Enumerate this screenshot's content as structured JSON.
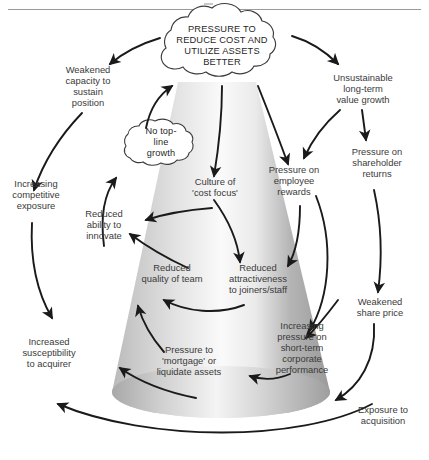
{
  "diagram": {
    "type": "causal-loop-vicious-cycle",
    "central_cloud": {
      "id": "pressure-to-reduce-cost",
      "text": "PRESSURE TO\nREDUCE COST AND\nUTILIZE ASSETS\nBETTER"
    },
    "secondary_cloud": {
      "id": "no-top-line-growth",
      "text": "No top-\nline\ngrowth"
    },
    "nodes": [
      {
        "id": "weakened-capacity",
        "text": "Weakened\ncapacity to\nsustain\nposition"
      },
      {
        "id": "unsustainable-growth",
        "text": "Unsustainable\nlong-term\nvalue growth"
      },
      {
        "id": "pressure-shareholder",
        "text": "Pressure on\nshareholder\nreturns"
      },
      {
        "id": "increasing-competitive",
        "text": "Increasing\ncompetitive\nexposure"
      },
      {
        "id": "reduced-ability-innovate",
        "text": "Reduced\nability to\ninnovate"
      },
      {
        "id": "culture-cost-focus",
        "text": "Culture of\n'cost focus'"
      },
      {
        "id": "pressure-employee-rewards",
        "text": "Pressure on\nemployee\nrewards"
      },
      {
        "id": "reduced-quality-team",
        "text": "Reduced\nquality of team"
      },
      {
        "id": "reduced-attractiveness",
        "text": "Reduced\nattractiveness\nto joiners/staff"
      },
      {
        "id": "weakened-share-price",
        "text": "Weakened\nshare price"
      },
      {
        "id": "increased-susceptibility",
        "text": "Increased\nsusceptibility\nto acquirer"
      },
      {
        "id": "pressure-mortgage-assets",
        "text": "Pressure to\n'mortgage' or\nliquidate assets"
      },
      {
        "id": "increasing-short-term",
        "text": "Increasing\npressure on\nshort-term\ncorporate\nperformance"
      },
      {
        "id": "exposure-acquisition",
        "text": "Exposure to\nacquisition"
      }
    ],
    "colors": {
      "arrow": "#1a1a1a",
      "cone_edge": "#8f8f8f",
      "cone_light": "#f7f7f7",
      "cone_dark": "#9d9d9d",
      "text": "#3a3a3a",
      "rule": "#9a9a9a"
    }
  }
}
